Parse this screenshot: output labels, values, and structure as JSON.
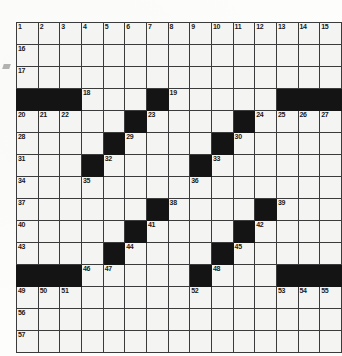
{
  "puzzle": {
    "title": "Crossword Grid",
    "rows": 15,
    "cols": 15,
    "colors": {
      "cell_fill": "#f4f4f2",
      "block_fill": "#141414",
      "grid_line": "#3b3b3b",
      "number_text": "#1a1a1a",
      "paper": "#fdfdfc"
    },
    "grid": [
      [
        {
          "block": false,
          "number": "1"
        },
        {
          "block": false,
          "number": "2"
        },
        {
          "block": false,
          "number": "3"
        },
        {
          "block": false,
          "number": "4"
        },
        {
          "block": false,
          "number": "5"
        },
        {
          "block": false,
          "number": "6"
        },
        {
          "block": false,
          "number": "7"
        },
        {
          "block": false,
          "number": "8"
        },
        {
          "block": false,
          "number": "9"
        },
        {
          "block": false,
          "number": "10"
        },
        {
          "block": false,
          "number": "11"
        },
        {
          "block": false,
          "number": "12"
        },
        {
          "block": false,
          "number": "13"
        },
        {
          "block": false,
          "number": "14"
        },
        {
          "block": false,
          "number": "15"
        }
      ],
      [
        {
          "block": false,
          "number": "16"
        },
        {
          "block": false,
          "number": ""
        },
        {
          "block": false,
          "number": ""
        },
        {
          "block": false,
          "number": ""
        },
        {
          "block": false,
          "number": ""
        },
        {
          "block": false,
          "number": ""
        },
        {
          "block": false,
          "number": ""
        },
        {
          "block": false,
          "number": ""
        },
        {
          "block": false,
          "number": ""
        },
        {
          "block": false,
          "number": ""
        },
        {
          "block": false,
          "number": ""
        },
        {
          "block": false,
          "number": ""
        },
        {
          "block": false,
          "number": ""
        },
        {
          "block": false,
          "number": ""
        },
        {
          "block": false,
          "number": ""
        }
      ],
      [
        {
          "block": false,
          "number": "17"
        },
        {
          "block": false,
          "number": ""
        },
        {
          "block": false,
          "number": ""
        },
        {
          "block": false,
          "number": ""
        },
        {
          "block": false,
          "number": ""
        },
        {
          "block": false,
          "number": ""
        },
        {
          "block": false,
          "number": ""
        },
        {
          "block": false,
          "number": ""
        },
        {
          "block": false,
          "number": ""
        },
        {
          "block": false,
          "number": ""
        },
        {
          "block": false,
          "number": ""
        },
        {
          "block": false,
          "number": ""
        },
        {
          "block": false,
          "number": ""
        },
        {
          "block": false,
          "number": ""
        },
        {
          "block": false,
          "number": ""
        }
      ],
      [
        {
          "block": true,
          "number": ""
        },
        {
          "block": true,
          "number": ""
        },
        {
          "block": true,
          "number": ""
        },
        {
          "block": false,
          "number": "18"
        },
        {
          "block": false,
          "number": ""
        },
        {
          "block": false,
          "number": ""
        },
        {
          "block": true,
          "number": ""
        },
        {
          "block": false,
          "number": "19"
        },
        {
          "block": false,
          "number": ""
        },
        {
          "block": false,
          "number": ""
        },
        {
          "block": false,
          "number": ""
        },
        {
          "block": false,
          "number": ""
        },
        {
          "block": true,
          "number": ""
        },
        {
          "block": true,
          "number": ""
        },
        {
          "block": true,
          "number": ""
        }
      ],
      [
        {
          "block": false,
          "number": "20"
        },
        {
          "block": false,
          "number": "21"
        },
        {
          "block": false,
          "number": "22"
        },
        {
          "block": false,
          "number": ""
        },
        {
          "block": false,
          "number": ""
        },
        {
          "block": true,
          "number": ""
        },
        {
          "block": false,
          "number": "23"
        },
        {
          "block": false,
          "number": ""
        },
        {
          "block": false,
          "number": ""
        },
        {
          "block": false,
          "number": ""
        },
        {
          "block": true,
          "number": ""
        },
        {
          "block": false,
          "number": "24"
        },
        {
          "block": false,
          "number": "25"
        },
        {
          "block": false,
          "number": "26"
        },
        {
          "block": false,
          "number": "27"
        }
      ],
      [
        {
          "block": false,
          "number": "28"
        },
        {
          "block": false,
          "number": ""
        },
        {
          "block": false,
          "number": ""
        },
        {
          "block": false,
          "number": ""
        },
        {
          "block": true,
          "number": ""
        },
        {
          "block": false,
          "number": "29"
        },
        {
          "block": false,
          "number": ""
        },
        {
          "block": false,
          "number": ""
        },
        {
          "block": false,
          "number": ""
        },
        {
          "block": true,
          "number": ""
        },
        {
          "block": false,
          "number": "30"
        },
        {
          "block": false,
          "number": ""
        },
        {
          "block": false,
          "number": ""
        },
        {
          "block": false,
          "number": ""
        },
        {
          "block": false,
          "number": ""
        }
      ],
      [
        {
          "block": false,
          "number": "31"
        },
        {
          "block": false,
          "number": ""
        },
        {
          "block": false,
          "number": ""
        },
        {
          "block": true,
          "number": ""
        },
        {
          "block": false,
          "number": "32"
        },
        {
          "block": false,
          "number": ""
        },
        {
          "block": false,
          "number": ""
        },
        {
          "block": false,
          "number": ""
        },
        {
          "block": true,
          "number": ""
        },
        {
          "block": false,
          "number": "33"
        },
        {
          "block": false,
          "number": ""
        },
        {
          "block": false,
          "number": ""
        },
        {
          "block": false,
          "number": ""
        },
        {
          "block": false,
          "number": ""
        },
        {
          "block": false,
          "number": ""
        }
      ],
      [
        {
          "block": false,
          "number": "34"
        },
        {
          "block": false,
          "number": ""
        },
        {
          "block": false,
          "number": ""
        },
        {
          "block": false,
          "number": "35"
        },
        {
          "block": false,
          "number": ""
        },
        {
          "block": false,
          "number": ""
        },
        {
          "block": false,
          "number": ""
        },
        {
          "block": false,
          "number": ""
        },
        {
          "block": false,
          "number": "36"
        },
        {
          "block": false,
          "number": ""
        },
        {
          "block": false,
          "number": ""
        },
        {
          "block": false,
          "number": ""
        },
        {
          "block": false,
          "number": ""
        },
        {
          "block": false,
          "number": ""
        },
        {
          "block": false,
          "number": ""
        }
      ],
      [
        {
          "block": false,
          "number": "37"
        },
        {
          "block": false,
          "number": ""
        },
        {
          "block": false,
          "number": ""
        },
        {
          "block": false,
          "number": ""
        },
        {
          "block": false,
          "number": ""
        },
        {
          "block": false,
          "number": ""
        },
        {
          "block": true,
          "number": ""
        },
        {
          "block": false,
          "number": "38"
        },
        {
          "block": false,
          "number": ""
        },
        {
          "block": false,
          "number": ""
        },
        {
          "block": false,
          "number": ""
        },
        {
          "block": true,
          "number": ""
        },
        {
          "block": false,
          "number": "39"
        },
        {
          "block": false,
          "number": ""
        },
        {
          "block": false,
          "number": ""
        }
      ],
      [
        {
          "block": false,
          "number": "40"
        },
        {
          "block": false,
          "number": ""
        },
        {
          "block": false,
          "number": ""
        },
        {
          "block": false,
          "number": ""
        },
        {
          "block": false,
          "number": ""
        },
        {
          "block": true,
          "number": ""
        },
        {
          "block": false,
          "number": "41"
        },
        {
          "block": false,
          "number": ""
        },
        {
          "block": false,
          "number": ""
        },
        {
          "block": false,
          "number": ""
        },
        {
          "block": true,
          "number": ""
        },
        {
          "block": false,
          "number": "42"
        },
        {
          "block": false,
          "number": ""
        },
        {
          "block": false,
          "number": ""
        },
        {
          "block": false,
          "number": ""
        }
      ],
      [
        {
          "block": false,
          "number": "43"
        },
        {
          "block": false,
          "number": ""
        },
        {
          "block": false,
          "number": ""
        },
        {
          "block": false,
          "number": ""
        },
        {
          "block": true,
          "number": ""
        },
        {
          "block": false,
          "number": "44"
        },
        {
          "block": false,
          "number": ""
        },
        {
          "block": false,
          "number": ""
        },
        {
          "block": false,
          "number": ""
        },
        {
          "block": true,
          "number": ""
        },
        {
          "block": false,
          "number": "45"
        },
        {
          "block": false,
          "number": ""
        },
        {
          "block": false,
          "number": ""
        },
        {
          "block": false,
          "number": ""
        },
        {
          "block": false,
          "number": ""
        }
      ],
      [
        {
          "block": true,
          "number": ""
        },
        {
          "block": true,
          "number": ""
        },
        {
          "block": true,
          "number": ""
        },
        {
          "block": false,
          "number": "46"
        },
        {
          "block": false,
          "number": "47"
        },
        {
          "block": false,
          "number": ""
        },
        {
          "block": false,
          "number": ""
        },
        {
          "block": false,
          "number": ""
        },
        {
          "block": true,
          "number": ""
        },
        {
          "block": false,
          "number": "48"
        },
        {
          "block": false,
          "number": ""
        },
        {
          "block": false,
          "number": ""
        },
        {
          "block": true,
          "number": ""
        },
        {
          "block": true,
          "number": ""
        },
        {
          "block": true,
          "number": ""
        }
      ],
      [
        {
          "block": false,
          "number": "49"
        },
        {
          "block": false,
          "number": "50"
        },
        {
          "block": false,
          "number": "51"
        },
        {
          "block": false,
          "number": ""
        },
        {
          "block": false,
          "number": ""
        },
        {
          "block": false,
          "number": ""
        },
        {
          "block": false,
          "number": ""
        },
        {
          "block": false,
          "number": ""
        },
        {
          "block": false,
          "number": "52"
        },
        {
          "block": false,
          "number": ""
        },
        {
          "block": false,
          "number": ""
        },
        {
          "block": false,
          "number": ""
        },
        {
          "block": false,
          "number": "53"
        },
        {
          "block": false,
          "number": "54"
        },
        {
          "block": false,
          "number": "55"
        }
      ],
      [
        {
          "block": false,
          "number": "56"
        },
        {
          "block": false,
          "number": ""
        },
        {
          "block": false,
          "number": ""
        },
        {
          "block": false,
          "number": ""
        },
        {
          "block": false,
          "number": ""
        },
        {
          "block": false,
          "number": ""
        },
        {
          "block": false,
          "number": ""
        },
        {
          "block": false,
          "number": ""
        },
        {
          "block": false,
          "number": ""
        },
        {
          "block": false,
          "number": ""
        },
        {
          "block": false,
          "number": ""
        },
        {
          "block": false,
          "number": ""
        },
        {
          "block": false,
          "number": ""
        },
        {
          "block": false,
          "number": ""
        },
        {
          "block": false,
          "number": ""
        }
      ],
      [
        {
          "block": false,
          "number": "57"
        },
        {
          "block": false,
          "number": ""
        },
        {
          "block": false,
          "number": ""
        },
        {
          "block": false,
          "number": ""
        },
        {
          "block": false,
          "number": ""
        },
        {
          "block": false,
          "number": ""
        },
        {
          "block": false,
          "number": ""
        },
        {
          "block": false,
          "number": ""
        },
        {
          "block": false,
          "number": ""
        },
        {
          "block": false,
          "number": ""
        },
        {
          "block": false,
          "number": ""
        },
        {
          "block": false,
          "number": ""
        },
        {
          "block": false,
          "number": ""
        },
        {
          "block": false,
          "number": ""
        },
        {
          "block": false,
          "number": ""
        }
      ]
    ]
  }
}
